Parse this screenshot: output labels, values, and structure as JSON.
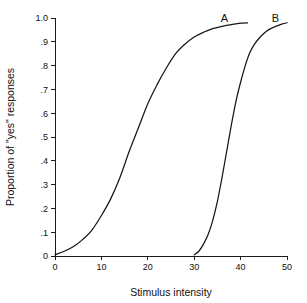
{
  "chart_data": {
    "type": "line",
    "title": "",
    "xlabel": "Stimulus intensity",
    "ylabel": "Proportion of \"yes\" responses",
    "xlim": [
      0,
      50
    ],
    "ylim": [
      0,
      1.0
    ],
    "grid": false,
    "legend_position": "inline-curve-labels",
    "xticks": [
      0,
      10,
      20,
      30,
      40,
      50
    ],
    "xtick_labels": [
      "0",
      "10",
      "20",
      "30",
      "40",
      "50"
    ],
    "yticks": [
      0,
      0.1,
      0.2,
      0.3,
      0.4,
      0.5,
      0.6,
      0.7,
      0.8,
      0.9,
      1.0
    ],
    "ytick_labels": [
      "0",
      ".1",
      ".2",
      ".3",
      ".4",
      ".5",
      ".6",
      ".7",
      ".8",
      ".9",
      "1.0"
    ],
    "series": [
      {
        "name": "A",
        "label": "A",
        "color": "#161616",
        "midpoint": 17,
        "x": [
          0,
          2,
          4,
          6,
          8,
          10,
          12,
          14,
          16,
          18,
          20,
          22,
          24,
          26,
          28,
          30,
          32,
          34,
          36,
          38,
          40,
          41.5
        ],
        "values": [
          0.005,
          0.02,
          0.04,
          0.07,
          0.11,
          0.17,
          0.24,
          0.33,
          0.44,
          0.54,
          0.64,
          0.72,
          0.79,
          0.85,
          0.89,
          0.92,
          0.94,
          0.955,
          0.965,
          0.972,
          0.978,
          0.98
        ]
      },
      {
        "name": "B",
        "label": "B",
        "color": "#161616",
        "midpoint": 37.5,
        "x": [
          30,
          31,
          32,
          33,
          34,
          35,
          36,
          37,
          38,
          39,
          40,
          41,
          42,
          43,
          44,
          45,
          46,
          47,
          48,
          49,
          50
        ],
        "values": [
          0.005,
          0.02,
          0.05,
          0.09,
          0.15,
          0.23,
          0.33,
          0.44,
          0.55,
          0.65,
          0.73,
          0.8,
          0.855,
          0.89,
          0.915,
          0.935,
          0.95,
          0.96,
          0.968,
          0.975,
          0.98
        ]
      }
    ],
    "annotations": [
      {
        "text": "A",
        "x": 36.5,
        "y": 1.0
      },
      {
        "text": "B",
        "x": 47.5,
        "y": 1.0
      }
    ]
  }
}
